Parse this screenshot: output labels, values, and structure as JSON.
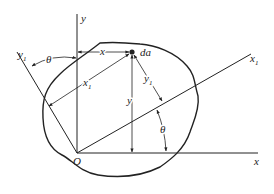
{
  "diagram": {
    "labels": {
      "y_axis": "y",
      "x_axis": "x",
      "x1_axis": "x",
      "x1_sub": "1",
      "y1_axis": "y",
      "y1_sub": "1",
      "origin": "O",
      "element": "da",
      "dim_x": "x",
      "dim_y": "y",
      "dim_x1": "x",
      "dim_x1_sub": "1",
      "dim_y1": "y",
      "dim_y1_sub": "1",
      "theta_top": "θ",
      "theta_right": "θ"
    },
    "colors": {
      "ink": "#222222",
      "background": "#ffffff"
    }
  }
}
